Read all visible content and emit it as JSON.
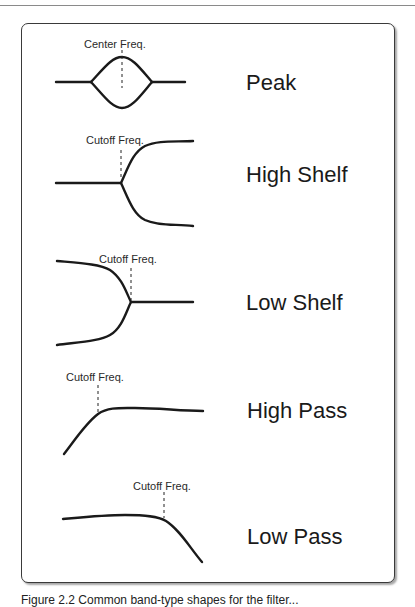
{
  "diagram": {
    "type": "eq-filter-shapes",
    "colors": {
      "stroke": "#1a1a1a",
      "frame": "#3a3a3a",
      "background": "#ffffff"
    },
    "filters": [
      {
        "name": "Peak",
        "marker_label": "Center Freq."
      },
      {
        "name": "High Shelf",
        "marker_label": "Cutoff Freq."
      },
      {
        "name": "Low Shelf",
        "marker_label": "Cutoff Freq."
      },
      {
        "name": "High Pass",
        "marker_label": "Cutoff Freq."
      },
      {
        "name": "Low Pass",
        "marker_label": "Cutoff Freq."
      }
    ]
  },
  "caption": {
    "text": "Figure 2.2 Common band-type shapes for the filter..."
  }
}
